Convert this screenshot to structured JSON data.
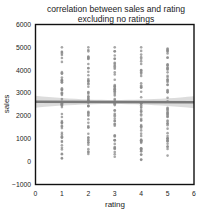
{
  "chart_data": {
    "type": "scatter",
    "title": "correlation between sales and rating excluding no ratings",
    "title_lines": [
      "correlation between sales and rating",
      "excluding no ratings"
    ],
    "xlabel": "rating",
    "ylabel": "sales",
    "xlim": [
      0,
      6
    ],
    "ylim": [
      -1000,
      6000
    ],
    "xticks": [
      0,
      1,
      2,
      3,
      4,
      5,
      6
    ],
    "yticks": [
      -1000,
      0,
      1000,
      2000,
      3000,
      4000,
      5000,
      6000
    ],
    "grid": false,
    "legend": null,
    "series": [
      {
        "name": "rating vs sales",
        "points_by_rating": [
          {
            "x": 1,
            "y_min": 100,
            "y_max": 5000
          },
          {
            "x": 2,
            "y_min": 300,
            "y_max": 5000
          },
          {
            "x": 3,
            "y_min": 150,
            "y_max": 5000
          },
          {
            "x": 4,
            "y_min": 50,
            "y_max": 5000
          },
          {
            "x": 5,
            "y_min": 200,
            "y_max": 4950
          }
        ]
      }
    ],
    "regression": {
      "y_at_x0": 2620,
      "y_at_x6": 2600,
      "ci_halfwidth_edge": 260,
      "ci_halfwidth_center": 90
    },
    "colors": {
      "points": "#8a8a8a",
      "regression_line": "#7a7a7a",
      "ci_band": "#d6d6d6",
      "frame": "#111111"
    }
  }
}
